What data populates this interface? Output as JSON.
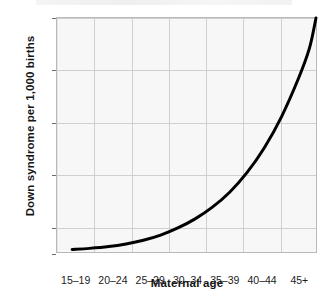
{
  "chart_data": {
    "type": "line",
    "title": "",
    "xlabel": "Maternal age",
    "ylabel": "Down syndrome per 1,000 births",
    "categories": [
      "15–19",
      "20–24",
      "25–29",
      "30–34",
      "35–39",
      "40–44",
      "45+"
    ],
    "values": [
      0.2,
      0.3,
      0.6,
      1.2,
      2.8,
      7.4,
      18.0
    ],
    "x": [
      0,
      1,
      2,
      3,
      4,
      5,
      6
    ],
    "xlim": [
      0,
      6
    ],
    "ylim": [
      0,
      18
    ],
    "y_ticks": [
      0,
      2,
      6,
      10,
      14,
      18
    ],
    "y_tick_labels": [
      "0",
      "2",
      "6",
      "10",
      "14",
      "18"
    ],
    "grid": true,
    "legend": false,
    "series": [
      {
        "name": "Down syndrome rate",
        "color": "#000000",
        "line_width": 3,
        "values": [
          0.2,
          0.3,
          0.6,
          1.2,
          2.8,
          7.4,
          18.0
        ]
      }
    ],
    "curve_points": [
      [
        0.35,
        0.2
      ],
      [
        0.75,
        0.28
      ],
      [
        1.2,
        0.42
      ],
      [
        1.6,
        0.62
      ],
      [
        2.0,
        0.9
      ],
      [
        2.4,
        1.3
      ],
      [
        2.8,
        1.85
      ],
      [
        3.2,
        2.55
      ],
      [
        3.6,
        3.45
      ],
      [
        4.0,
        4.6
      ],
      [
        4.4,
        6.1
      ],
      [
        4.8,
        8.0
      ],
      [
        5.2,
        10.4
      ],
      [
        5.6,
        13.4
      ],
      [
        5.85,
        15.7
      ],
      [
        6.0,
        18.0
      ]
    ],
    "colors": {
      "curve": "#000000",
      "plot_background": "#f7f7f7",
      "plot_border": "#b9b9b9",
      "gridline": "#cfcfcf",
      "text": "#161616",
      "page_background": "#ffffff"
    }
  }
}
